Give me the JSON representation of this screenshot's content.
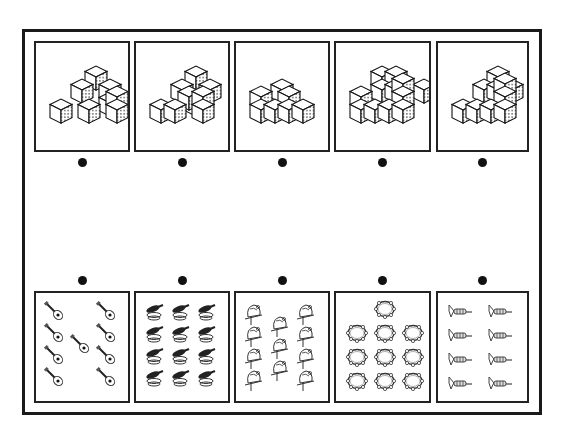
{
  "worksheet": {
    "title": "Match the cube stack to the group of instruments with the same count",
    "top_row": [
      {
        "id": "cubes-1",
        "cube_count": 8
      },
      {
        "id": "cubes-2",
        "cube_count": 9
      },
      {
        "id": "cubes-3",
        "cube_count": 7
      },
      {
        "id": "cubes-4",
        "cube_count": 12
      },
      {
        "id": "cubes-5",
        "cube_count": 10
      }
    ],
    "bottom_row": [
      {
        "id": "guitars",
        "item": "guitar",
        "count": 9
      },
      {
        "id": "harmonicas",
        "item": "harmonica",
        "count": 12
      },
      {
        "id": "bells",
        "item": "bell",
        "count": 11
      },
      {
        "id": "tambourines",
        "item": "tambourine",
        "count": 10
      },
      {
        "id": "trumpets",
        "item": "trumpet",
        "count": 8
      }
    ],
    "colors": {
      "ink": "#1a1a1a",
      "shade": "#9a9a9a",
      "paper": "#ffffff"
    }
  }
}
